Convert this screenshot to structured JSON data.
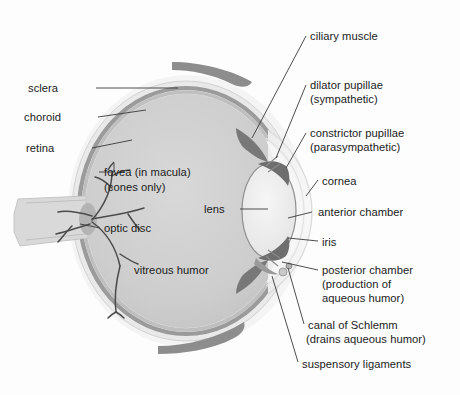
{
  "figure": {
    "palette": {
      "background": "#fdfdfd",
      "sclera": "#e9e9e9",
      "choroid": "#9a9a9a",
      "retina": "#c4c4c4",
      "vitreous": "#cdcdcd",
      "lens": "#efefef",
      "cornea": "#f2f2f2",
      "iris_dark": "#6e6e6e",
      "muscle_dark": "#8a8a8a",
      "vessel": "#4a4a4a",
      "leader_line": "#3a3a3a",
      "text": "#1b1b1b"
    }
  },
  "labels": {
    "sclera": "sclera",
    "choroid": "choroid",
    "retina": "retina",
    "fovea_line1": "fovea (in macula)",
    "fovea_line2": "(cones only)",
    "optic_disc": "optic disc",
    "vitreous_humor": "vitreous humor",
    "lens": "lens",
    "ciliary_muscle": "ciliary muscle",
    "dilator_line1": "dilator pupillae",
    "dilator_line2": "(sympathetic)",
    "constrictor_line1": "constrictor pupillae",
    "constrictor_line2": "(parasympathetic)",
    "cornea": "cornea",
    "anterior_chamber": "anterior chamber",
    "iris": "iris",
    "posterior_line1": "posterior chamber",
    "posterior_line2": "(production of",
    "posterior_line3": "aqueous humor)",
    "schlemm_line1": "canal of Schlemm",
    "schlemm_line2": "(drains aqueous humor)",
    "suspensory_ligaments": "suspensory ligaments"
  }
}
